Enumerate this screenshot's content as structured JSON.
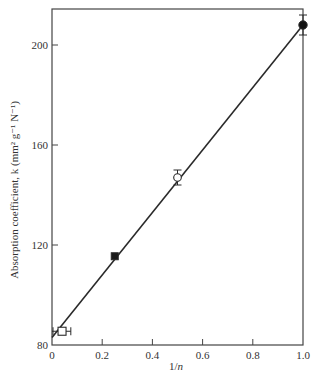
{
  "chart_data": {
    "type": "scatter",
    "title": "",
    "xlabel": "1/n",
    "ylabel": "Absorption coefficient, k (mm² g⁻¹ N⁻¹)",
    "xlim": [
      0,
      1.0
    ],
    "ylim": [
      80,
      213
    ],
    "xticks": [
      0,
      0.2,
      0.4,
      0.6,
      0.8,
      1.0
    ],
    "xtick_labels": [
      "0",
      "0.2",
      "0.4",
      "0.6",
      "0.8",
      "1.0"
    ],
    "yticks": [
      80,
      120,
      160,
      200
    ],
    "ytick_labels": [
      "80",
      "120",
      "160",
      "200"
    ],
    "grid": false,
    "legend": null,
    "points": [
      {
        "x": 0.04,
        "y": 85.5,
        "marker": "open-square",
        "xerr": [
          0.04,
          0.035
        ],
        "yerr": null
      },
      {
        "x": 0.25,
        "y": 115.5,
        "marker": "filled-square",
        "xerr": null,
        "yerr": null
      },
      {
        "x": 0.5,
        "y": 147,
        "marker": "open-circle",
        "xerr": null,
        "yerr": 3
      },
      {
        "x": 1.0,
        "y": 208,
        "marker": "filled-circle",
        "xerr": null,
        "yerr": 4
      }
    ],
    "fit_line": {
      "x": [
        0,
        1.0
      ],
      "y": [
        83,
        208
      ]
    }
  }
}
